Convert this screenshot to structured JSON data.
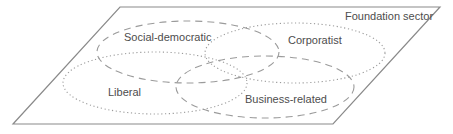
{
  "diagram": {
    "type": "venn-parallelogram",
    "title": "Foundation sector",
    "ellipses": [
      {
        "label": "Social-democratic",
        "line_style": "dashed"
      },
      {
        "label": "Corporatist",
        "line_style": "dotted"
      },
      {
        "label": "Liberal",
        "line_style": "dotted"
      },
      {
        "label": "Business-related",
        "line_style": "dashed"
      }
    ],
    "colors": {
      "plane_outline": "#8a8a8a",
      "ellipse_stroke": "#9b9b9b",
      "label_text": "#4d4d4d",
      "background": "#ffffff"
    }
  }
}
